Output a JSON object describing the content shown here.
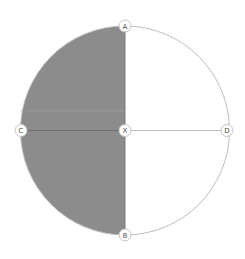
{
  "diagram": {
    "type": "circle-with-shaded-half",
    "colors": {
      "shade": "#8c8c8c",
      "shade_band": "#969696",
      "stroke": "#bdbdbd",
      "node_fill": "#ffffff",
      "node_stroke": "#c4c4c4",
      "label": "#555555"
    },
    "circle": {
      "cx": 125,
      "cy": 130.5,
      "r": 104.5
    },
    "shaded_region": "left-half",
    "nodes": [
      {
        "id": "A",
        "label": "A",
        "x": 125,
        "y": 26
      },
      {
        "id": "B",
        "label": "B",
        "x": 125,
        "y": 235
      },
      {
        "id": "C",
        "label": "C",
        "x": 21,
        "y": 130.5
      },
      {
        "id": "D",
        "label": "D",
        "x": 227,
        "y": 130.5
      },
      {
        "id": "X",
        "label": "X",
        "x": 125,
        "y": 130.5
      }
    ],
    "segments": [
      {
        "from": "A",
        "to": "B"
      },
      {
        "from": "C",
        "to": "X"
      },
      {
        "from": "X",
        "to": "D"
      }
    ]
  }
}
